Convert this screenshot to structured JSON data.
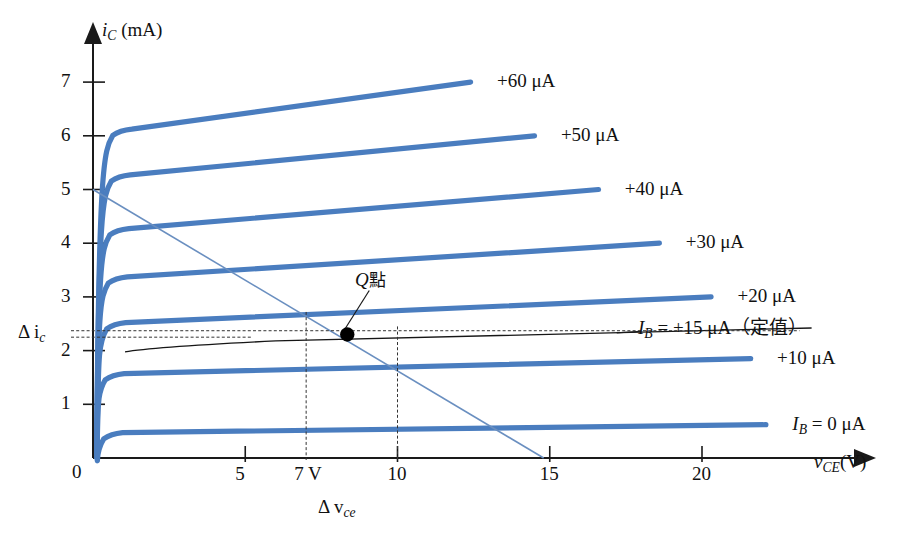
{
  "figure": {
    "kind": "transistor-output-characteristics",
    "background": "#ffffff",
    "curve_color": "#4a7dbf",
    "loadline_color": "#6a8fc0",
    "ib_curve_color": "#161616"
  },
  "axes": {
    "y_title_main": "i",
    "y_title_sub": "C",
    "y_title_unit": "(mA)",
    "x_title_main": "v",
    "x_title_sub": "CE",
    "x_title_unit": "(V)",
    "origin_label": "0",
    "y_ticks": [
      "1",
      "2",
      "3",
      "4",
      "5",
      "6",
      "7"
    ],
    "x_ticks": [
      "5",
      "10",
      "15",
      "20"
    ],
    "x_special_tick": "7 V"
  },
  "annotations": {
    "delta_ic": "Δ i",
    "delta_ic_sub": "c",
    "delta_vce": "Δ v",
    "delta_vce_sub": "ce",
    "q_point": "Q點",
    "ib_const_pre": "I",
    "ib_const_sub": "B",
    "ib_const_post": " = +15 μA（定值）"
  },
  "chart_data": {
    "type": "line",
    "title": "",
    "xlabel": "v_CE (V)",
    "ylabel": "i_C (mA)",
    "xlim": [
      0,
      24
    ],
    "ylim": [
      0,
      7.6
    ],
    "grid": false,
    "legend_position": "right-of-curve-ends",
    "x_tick_values": [
      0,
      5,
      7,
      10,
      15,
      20
    ],
    "y_tick_values": [
      0,
      1,
      2,
      3,
      4,
      5,
      6,
      7
    ],
    "series": [
      {
        "name": "+60 μA",
        "label": "+60 μA",
        "i_b_uA": 60,
        "knee_v": 0.75,
        "knee_i": 6.1,
        "end_v": 12.4,
        "end_i": 7.0,
        "label_x_v": 13.2,
        "label_y_i": 7.0
      },
      {
        "name": "+50 μA",
        "label": "+50 μA",
        "i_b_uA": 50,
        "knee_v": 0.7,
        "knee_i": 5.25,
        "end_v": 14.5,
        "end_i": 6.0,
        "label_x_v": 15.3,
        "label_y_i": 6.0
      },
      {
        "name": "+40 μA",
        "label": "+40 μA",
        "i_b_uA": 40,
        "knee_v": 0.65,
        "knee_i": 4.25,
        "end_v": 16.6,
        "end_i": 5.0,
        "label_x_v": 17.4,
        "label_y_i": 5.0
      },
      {
        "name": "+30 μA",
        "label": "+30 μA",
        "i_b_uA": 30,
        "knee_v": 0.6,
        "knee_i": 3.35,
        "end_v": 18.6,
        "end_i": 4.0,
        "label_x_v": 19.4,
        "label_y_i": 4.0
      },
      {
        "name": "+20 μA",
        "label": "+20 μA",
        "i_b_uA": 20,
        "knee_v": 0.55,
        "knee_i": 2.5,
        "end_v": 20.3,
        "end_i": 3.0,
        "label_x_v": 21.1,
        "label_y_i": 3.0
      },
      {
        "name": "+10 μA",
        "label": "+10 μA",
        "i_b_uA": 10,
        "knee_v": 0.5,
        "knee_i": 1.55,
        "end_v": 21.6,
        "end_i": 1.85,
        "label_x_v": 22.4,
        "label_y_i": 1.85
      },
      {
        "name": "I_B = 0 μA",
        "label": "I",
        "label_sub": "B",
        "label_post": " = 0 μA",
        "i_b_uA": 0,
        "knee_v": 0.45,
        "knee_i": 0.45,
        "end_v": 22.1,
        "end_i": 0.62,
        "label_x_v": 22.9,
        "label_y_i": 0.62
      }
    ],
    "load_line": {
      "name": "DC load line",
      "from": [
        0,
        5.0
      ],
      "to": [
        14.8,
        0
      ]
    },
    "ib_15_curve": {
      "name": "I_B = +15 μA (constant)",
      "knee_v": 0.5,
      "knee_i": 2.05,
      "end_v": 23.6,
      "end_i": 2.42
    },
    "q_point": {
      "label": "Q點",
      "v": 8.35,
      "i": 2.3
    },
    "delta_markers": {
      "delta_vce_from": 7.0,
      "delta_vce_to": 10.0,
      "delta_ic_upper": 2.37,
      "delta_ic_lower": 2.25
    }
  }
}
